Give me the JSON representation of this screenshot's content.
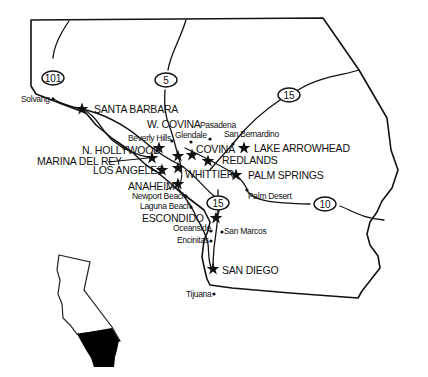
{
  "map": {
    "title": "Southern California",
    "highways": [
      {
        "id": "101",
        "label": "101",
        "x": 53,
        "y": 78
      },
      {
        "id": "5",
        "label": "5",
        "x": 166,
        "y": 80
      },
      {
        "id": "15n",
        "label": "15",
        "x": 289,
        "y": 95
      },
      {
        "id": "15s",
        "label": "15",
        "x": 218,
        "y": 203
      },
      {
        "id": "10",
        "label": "10",
        "x": 325,
        "y": 204
      }
    ],
    "major_cities": [
      {
        "name": "SANTA BARBARA",
        "star_x": 82,
        "star_y": 109,
        "label_x": 94,
        "label_y": 113
      },
      {
        "name": "W. COVINA",
        "label_x": 147,
        "label_y": 128
      },
      {
        "name": "N. HOLLYWOOD",
        "star_x": 159,
        "star_y": 148,
        "label_x": 82,
        "label_y": 154
      },
      {
        "name": "MARINA DEL REY",
        "star_x": 152,
        "star_y": 158,
        "label_x": 37,
        "label_y": 165
      },
      {
        "name": "LOS ANGELES",
        "star_x": 162,
        "star_y": 170,
        "label_x": 93,
        "label_y": 174
      },
      {
        "name": "COVINA",
        "star_x": 192,
        "star_y": 155,
        "label_x": 196,
        "label_y": 153
      },
      {
        "name": "REDLANDS",
        "star_x": 208,
        "star_y": 161,
        "label_x": 222,
        "label_y": 164
      },
      {
        "name": "LAKE ARROWHEAD",
        "star_x": 244,
        "star_y": 148,
        "label_x": 254,
        "label_y": 152
      },
      {
        "name": "WHITTIER",
        "label_x": 185,
        "label_y": 178
      },
      {
        "name": "PALM SPRINGS",
        "star_x": 236,
        "star_y": 175,
        "label_x": 248,
        "label_y": 179
      },
      {
        "name": "ANAHEIM",
        "star_x": 178,
        "star_y": 184,
        "label_x": 128,
        "label_y": 190
      },
      {
        "name": "ESCONDIDO",
        "star_x": 216,
        "star_y": 218,
        "label_x": 142,
        "label_y": 222
      },
      {
        "name": "SAN DIEGO",
        "star_x": 213,
        "star_y": 269,
        "label_x": 222,
        "label_y": 274
      }
    ],
    "extra_stars": [
      {
        "x": 178,
        "y": 156
      },
      {
        "x": 178,
        "y": 168
      }
    ],
    "minor_cities": [
      {
        "name": "Solvang",
        "dot_x": 53,
        "dot_y": 99,
        "label_x": 21,
        "label_y": 102
      },
      {
        "name": "Pasadena",
        "dot_x": 210,
        "dot_y": 139,
        "label_x": 200,
        "label_y": 128
      },
      {
        "name": "Beverly Hills",
        "dot_x": 172,
        "dot_y": 141,
        "label_x": 128,
        "label_y": 141
      },
      {
        "name": "Glendale",
        "dot_x": 191,
        "dot_y": 142,
        "label_x": 175,
        "label_y": 138
      },
      {
        "name": "San Bernardino",
        "dot_x": 233,
        "dot_y": 144,
        "label_x": 224,
        "label_y": 137
      },
      {
        "name": "Palm Desert",
        "dot_x": 247,
        "dot_y": 190,
        "label_x": 248,
        "label_y": 199
      },
      {
        "name": "Newport Beach",
        "dot_x": 186,
        "dot_y": 196,
        "label_x": 132,
        "label_y": 199
      },
      {
        "name": "Laguna Beach",
        "dot_x": 191,
        "dot_y": 207,
        "label_x": 140,
        "label_y": 209
      },
      {
        "name": "Oceanside",
        "dot_x": 211,
        "dot_y": 231,
        "label_x": 173,
        "label_y": 231
      },
      {
        "name": "San Marcos",
        "dot_x": 222,
        "dot_y": 232,
        "label_x": 224,
        "label_y": 234
      },
      {
        "name": "Encinitas",
        "dot_x": 211,
        "dot_y": 241,
        "label_x": 177,
        "label_y": 243
      },
      {
        "name": "Tijuana",
        "dot_x": 214,
        "dot_y": 294,
        "label_x": 186,
        "label_y": 297
      }
    ],
    "inset": {
      "label": "California locator",
      "highlight_color": "#000000"
    }
  }
}
